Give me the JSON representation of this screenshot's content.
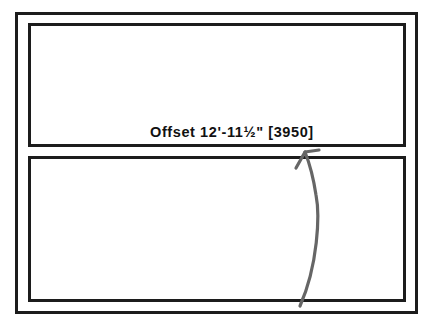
{
  "diagram": {
    "type": "window-sash-offset",
    "label": "Offset 12'-11½\" [3950]",
    "arrow": {
      "color": "#666666",
      "direction": "up",
      "from": [
        300,
        305
      ],
      "to": [
        305,
        152
      ]
    },
    "colors": {
      "frame": "#1c1c1c",
      "background": "#ffffff",
      "text": "#111111"
    }
  }
}
